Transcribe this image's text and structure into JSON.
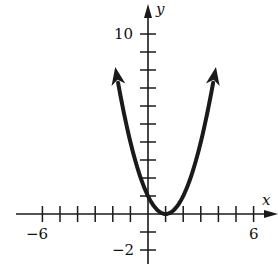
{
  "chart_data": {
    "type": "line",
    "title": "",
    "xlabel": "x",
    "ylabel": "y",
    "function": "y = (x - 1)^2",
    "xlim": [
      -6,
      6
    ],
    "ylim": [
      -2,
      10
    ],
    "x_tick_step": 1,
    "y_tick_step": 1,
    "x_tick_labels": [
      {
        "value": -6,
        "label": "−6"
      },
      {
        "value": 6,
        "label": "6"
      }
    ],
    "y_tick_labels": [
      {
        "value": 10,
        "label": "10"
      },
      {
        "value": -2,
        "label": "−2"
      }
    ],
    "grid": false,
    "legend": null,
    "series": [
      {
        "name": "parabola",
        "vertex": [
          1,
          0
        ],
        "y_intercept": 1,
        "x": [
          -1.7,
          -1,
          0,
          1,
          2,
          3,
          3.7
        ],
        "y": [
          7.3,
          4,
          1,
          0,
          1,
          4,
          7.3
        ],
        "arrows_at_ends": true
      }
    ]
  },
  "labels": {
    "x_axis": "x",
    "y_axis": "y",
    "x_min": "−6",
    "x_max": "6",
    "y_max": "10",
    "y_min": "−2"
  },
  "style": {
    "ink": "#1a1a1a",
    "background": "#ffffff"
  }
}
